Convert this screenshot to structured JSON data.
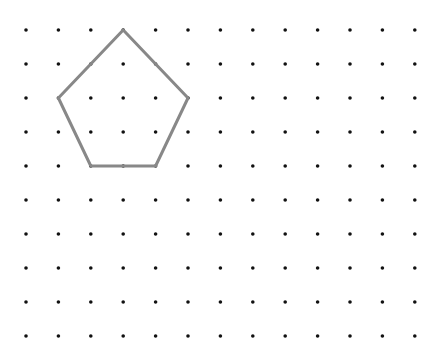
{
  "grid": {
    "columns": 13,
    "rows": 10,
    "origin_x": 26,
    "origin_y": 30,
    "spacing_x": 32.4,
    "spacing_y": 34,
    "dot_radius": 1.8,
    "dot_color": "#111111"
  },
  "shape": {
    "type": "pentagon",
    "stroke_color": "#888888",
    "stroke_width": 3,
    "vertices_grid": [
      [
        3,
        0
      ],
      [
        5,
        2
      ],
      [
        4,
        4
      ],
      [
        2,
        4
      ],
      [
        1,
        2
      ]
    ]
  }
}
